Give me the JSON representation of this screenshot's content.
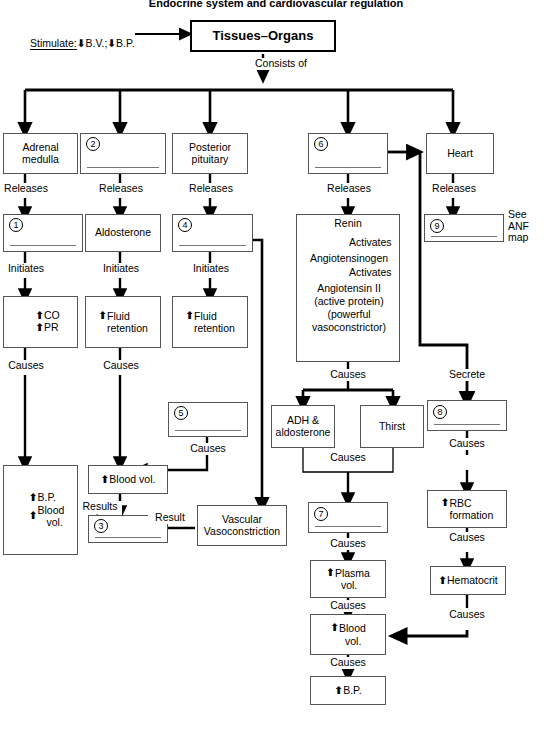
{
  "title": "Endocrine system and cardiovascular regulation",
  "header": {
    "stimulate_label": "Stimulate:",
    "stimulate_items": [
      "B.V.;",
      "B.P."
    ],
    "root_box": "Tissues–Organs",
    "root_edge": "Consists of"
  },
  "edge_labels": {
    "releases": "Releases",
    "initiates": "Initiates",
    "causes": "Causes",
    "activates": "Activates",
    "results_in": "Results\nin",
    "result": "Result",
    "secrete": "Secrete",
    "see_anf": "See\nANF\nmap"
  },
  "nodes": {
    "adrenal_medulla": {
      "label": "Adrenal\nmedulla"
    },
    "gland_2": {
      "number": "2",
      "label": ""
    },
    "posterior_pituitary": {
      "label": "Posterior\npituitary"
    },
    "gland_6": {
      "number": "6",
      "label": ""
    },
    "heart": {
      "label": "Heart"
    },
    "hormone_1": {
      "number": "1",
      "label": ""
    },
    "aldosterone": {
      "label": "Aldosterone"
    },
    "hormone_4": {
      "number": "4",
      "label": ""
    },
    "hormone_9": {
      "number": "9",
      "label": ""
    },
    "renin_cascade": {
      "lines": [
        "Renin",
        "Angiotensinogen",
        "Angiotensin II",
        "(active protein)",
        "(powerful",
        "vasoconstrictor)"
      ],
      "step1": "Activates",
      "step2": "Activates"
    },
    "co_pr": {
      "lines": [
        "CO",
        "PR"
      ],
      "arrows": [
        "up",
        "up"
      ]
    },
    "fluid_retention_a": {
      "lines": [
        "Fluid",
        "retention"
      ],
      "arrows": [
        "up"
      ]
    },
    "fluid_retention_b": {
      "lines": [
        "Fluid",
        "retention"
      ],
      "arrows": [
        "up"
      ]
    },
    "bp_bloodvol": {
      "lines": [
        "B.P.",
        "Blood",
        "vol."
      ],
      "arrows": [
        "up",
        "up"
      ]
    },
    "blood_vol_left": {
      "label": "Blood vol.",
      "arrows": [
        "up"
      ]
    },
    "effect_3": {
      "number": "3",
      "label": ""
    },
    "effect_5": {
      "number": "5",
      "label": ""
    },
    "vascular_vasoconstriction": {
      "label": "Vascular\nVasoconstriction"
    },
    "adh_aldosterone": {
      "label": "ADH &\naldosterone"
    },
    "thirst": {
      "label": "Thirst"
    },
    "effect_7": {
      "number": "7",
      "label": ""
    },
    "effect_8": {
      "number": "8",
      "label": ""
    },
    "plasma_vol": {
      "lines": [
        "Plasma",
        "vol."
      ],
      "arrows": [
        "up"
      ]
    },
    "rbc_formation": {
      "lines": [
        "RBC",
        "formation"
      ],
      "arrows": [
        "up"
      ]
    },
    "hematocrit": {
      "label": "Hematocrit",
      "arrows": [
        "up"
      ]
    },
    "blood_vol_bottom": {
      "lines": [
        "Blood",
        "vol."
      ],
      "arrows": [
        "up"
      ]
    },
    "bp_bottom": {
      "label": "B.P.",
      "arrows": [
        "up"
      ]
    }
  },
  "colors": {
    "line": "#000000",
    "box_border": "#555555",
    "fill_line": "#777777"
  }
}
